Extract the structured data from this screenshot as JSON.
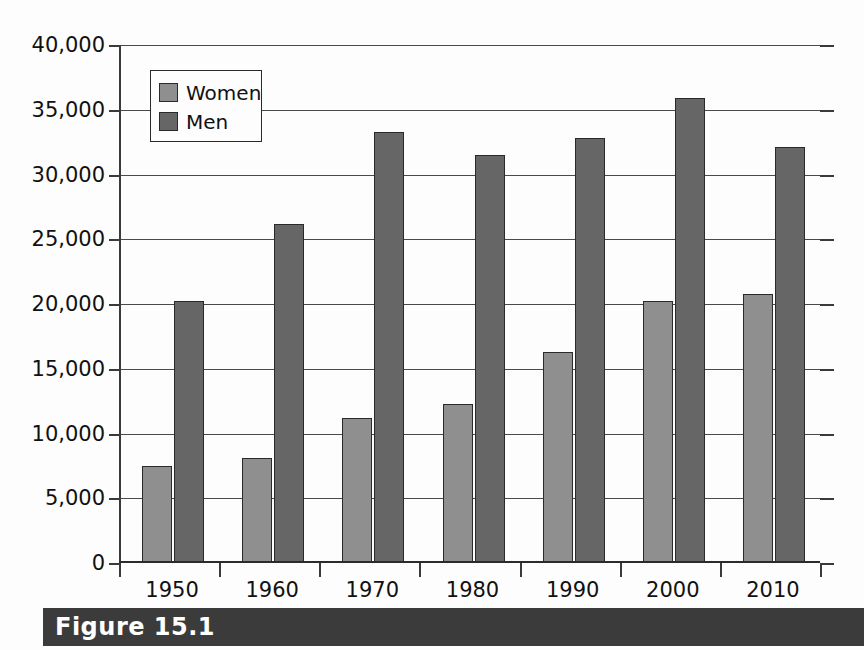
{
  "figure": {
    "caption": "Figure 15.1"
  },
  "legend": {
    "position": "top-left-inside",
    "entries": [
      {
        "label": "Women",
        "color": "#8f8f8f"
      },
      {
        "label": "Men",
        "color": "#666666"
      }
    ]
  },
  "axes": {
    "y_tick_labels": [
      "40,000",
      "35,000",
      "30,000",
      "25,000",
      "20,000",
      "15,000",
      "10,000",
      "5,000",
      "0"
    ],
    "x_tick_labels": [
      "1950",
      "1960",
      "1970",
      "1980",
      "1990",
      "2000",
      "2010"
    ]
  },
  "colors": {
    "women_bar": "#8f8f8f",
    "men_bar": "#666666",
    "axis": "#3a3a3a",
    "gridline": "#4a4a4a",
    "caption_banner": "#3b3b3b",
    "caption_text": "#ffffff",
    "background": "#fdfdfd"
  },
  "chart_data": {
    "type": "bar",
    "title": "",
    "subtitle": "",
    "xlabel": "",
    "ylabel": "",
    "categories": [
      "1950",
      "1960",
      "1970",
      "1980",
      "1990",
      "2000",
      "2010"
    ],
    "series": [
      {
        "name": "Women",
        "color": "#8f8f8f",
        "values": [
          7500,
          8100,
          11200,
          12300,
          16300,
          20200,
          20800
        ]
      },
      {
        "name": "Men",
        "color": "#666666",
        "values": [
          20200,
          26200,
          33300,
          31500,
          32800,
          35900,
          32100
        ]
      }
    ],
    "ylim": [
      0,
      40000
    ],
    "y_ticks": [
      0,
      5000,
      10000,
      15000,
      20000,
      25000,
      30000,
      35000,
      40000
    ],
    "grid": true,
    "grid_axis": "y",
    "legend_position": "upper left"
  }
}
